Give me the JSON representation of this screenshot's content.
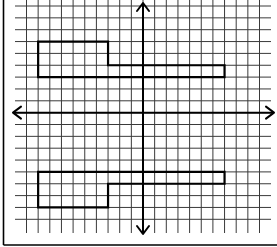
{
  "diagram": {
    "type": "coordinate-grid",
    "grid": {
      "columns_x": [
        26.5,
        38.15,
        49.8,
        61.45,
        73.1,
        84.75,
        96.4,
        108.05,
        119.7,
        131.35,
        143.0,
        154.65,
        166.3,
        177.95,
        189.6,
        201.25,
        212.9,
        224.55,
        236.2,
        247.85,
        259.5
      ],
      "rows_y": [
        6.0,
        17.85,
        29.7,
        41.55,
        53.4,
        65.25,
        77.1,
        88.95,
        100.8,
        112.65,
        124.5,
        136.35,
        148.2,
        160.05,
        171.9,
        183.75,
        195.6,
        207.45,
        219.3
      ],
      "v_line_top": 0,
      "v_line_bottom": 233,
      "h_line_left": 15,
      "h_line_right": 271,
      "line_color": "#3a3a3a"
    },
    "axes": {
      "x_axis_y": 112.65,
      "y_axis_x": 143.0,
      "x_arrow_left": 13,
      "x_arrow_right": 274,
      "y_arrow_top": 3,
      "y_arrow_bottom": 234,
      "color": "#000000"
    },
    "frame": {
      "left": 3.5,
      "bottom": 245,
      "color": "#000000"
    },
    "shapes": [
      {
        "name": "upper-figure",
        "points": [
          [
            38.15,
            41.55
          ],
          [
            108.05,
            41.55
          ],
          [
            108.05,
            65.25
          ],
          [
            224.55,
            65.25
          ],
          [
            224.55,
            77.1
          ],
          [
            38.15,
            77.1
          ]
        ],
        "grid_points": [
          [
            -9,
            6
          ],
          [
            -3,
            6
          ],
          [
            -3,
            4
          ],
          [
            7,
            4
          ],
          [
            7,
            3
          ],
          [
            -9,
            3
          ]
        ]
      },
      {
        "name": "lower-figure",
        "points": [
          [
            38.15,
            171.9
          ],
          [
            224.55,
            171.9
          ],
          [
            224.55,
            183.75
          ],
          [
            108.05,
            183.75
          ],
          [
            108.05,
            207.45
          ],
          [
            38.15,
            207.45
          ]
        ],
        "grid_points": [
          [
            -9,
            -5
          ],
          [
            7,
            -5
          ],
          [
            7,
            -6
          ],
          [
            -3,
            -6
          ],
          [
            -3,
            -8
          ],
          [
            -9,
            -8
          ]
        ]
      }
    ]
  }
}
